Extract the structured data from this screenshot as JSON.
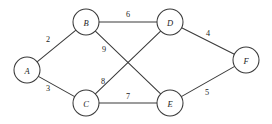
{
  "figure": {
    "background_color": "#ffffff",
    "stroke_color": "#3a3a3a",
    "text_color": "#1d1d1d",
    "width": 272,
    "height": 124
  },
  "chart_data": {
    "type": "diagram",
    "diagram_kind": "undirected-weighted-graph",
    "title": "",
    "nodes": [
      {
        "id": "A",
        "label": "A",
        "x": 27,
        "y": 70,
        "r": 13
      },
      {
        "id": "B",
        "label": "B",
        "x": 86,
        "y": 22,
        "r": 13
      },
      {
        "id": "C",
        "label": "C",
        "x": 86,
        "y": 103,
        "r": 13
      },
      {
        "id": "D",
        "label": "D",
        "x": 170,
        "y": 22,
        "r": 13
      },
      {
        "id": "E",
        "label": "E",
        "x": 170,
        "y": 103,
        "r": 13
      },
      {
        "id": "F",
        "label": "F",
        "x": 246,
        "y": 60,
        "r": 13
      }
    ],
    "edges": [
      {
        "id": "AB",
        "source": "A",
        "target": "B",
        "weight": 2,
        "label": "2",
        "label_x": 48,
        "label_y": 39
      },
      {
        "id": "AC",
        "source": "A",
        "target": "C",
        "weight": 3,
        "label": "3",
        "label_x": 48,
        "label_y": 88
      },
      {
        "id": "BD",
        "source": "B",
        "target": "D",
        "weight": 6,
        "label": "6",
        "label_x": 128,
        "label_y": 14
      },
      {
        "id": "BE",
        "source": "B",
        "target": "E",
        "weight": 9,
        "label": "9",
        "label_x": 104,
        "label_y": 49
      },
      {
        "id": "CD",
        "source": "C",
        "target": "D",
        "weight": 8,
        "label": "8",
        "label_x": 103,
        "label_y": 81
      },
      {
        "id": "CE",
        "source": "C",
        "target": "E",
        "weight": 7,
        "label": "7",
        "label_x": 128,
        "label_y": 96
      },
      {
        "id": "DF",
        "source": "D",
        "target": "F",
        "weight": 4,
        "label": "4",
        "label_x": 208,
        "label_y": 33
      },
      {
        "id": "EF",
        "source": "E",
        "target": "F",
        "weight": 5,
        "label": "5",
        "label_x": 207,
        "label_y": 92
      }
    ],
    "node_count": 6,
    "edge_count": 8,
    "weight_total": 44
  }
}
